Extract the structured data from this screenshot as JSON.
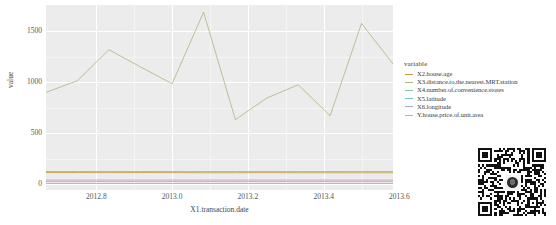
{
  "chart_data": {
    "type": "line",
    "title": "",
    "xlabel": "X1.transaction.date",
    "ylabel": "value",
    "legend_title": "variable",
    "legend_position": "right",
    "grid": true,
    "xlim": [
      2012.667,
      2013.583
    ],
    "ylim": [
      -60,
      1760
    ],
    "xticks": [
      "2012.8",
      "2013.0",
      "2013.2",
      "2013.4",
      "2013.6"
    ],
    "xtick_values": [
      2012.8,
      2013.0,
      2013.2,
      2013.4,
      2013.6
    ],
    "yticks": [
      "0",
      "500",
      "1000",
      "1500"
    ],
    "ytick_values": [
      0,
      500,
      1000,
      1500
    ],
    "x": [
      2012.667,
      2012.75,
      2012.833,
      2012.917,
      2013.0,
      2013.083,
      2013.167,
      2013.25,
      2013.333,
      2013.417,
      2013.5,
      2013.583
    ],
    "series": [
      {
        "name": "X2.house.age",
        "color": "#b8860b",
        "values": [
          112,
          112,
          111,
          112,
          111,
          110,
          110,
          111,
          110,
          110,
          109,
          109
        ]
      },
      {
        "name": "X3.distance.to.the.nearest.MRT.station",
        "color": "#9aa86b",
        "values": [
          900,
          1015,
          1320,
          1150,
          985,
          1690,
          632,
          845,
          975,
          670,
          1580,
          1180
        ]
      },
      {
        "name": "X4.number.of.convenience.stores",
        "color": "#5fbf8f",
        "values": [
          4,
          4,
          4,
          4,
          4,
          4,
          4,
          4,
          4,
          4,
          4,
          4
        ]
      },
      {
        "name": "X5.latitude",
        "color": "#4fb3c9",
        "values": [
          25,
          25,
          25,
          25,
          25,
          25,
          25,
          25,
          25,
          25,
          25,
          25
        ]
      },
      {
        "name": "X6.longitude",
        "color": "#9a8ed8",
        "values": [
          122,
          122,
          122,
          122,
          122,
          122,
          122,
          122,
          122,
          122,
          122,
          122
        ]
      },
      {
        "name": "Y.house.price.of.unit.area",
        "color": "#e07ab5",
        "values": [
          38,
          38,
          38,
          38,
          38,
          38,
          38,
          38,
          38,
          38,
          38,
          38
        ]
      }
    ]
  },
  "axes": {
    "y_title": "value",
    "x_title": "X1.transaction.date",
    "yticks": [
      "1500",
      "1000",
      "500",
      "0"
    ],
    "xticks": [
      "2012.8",
      "2013.0",
      "2013.2",
      "2013.4",
      "2013.6"
    ]
  },
  "legend": {
    "title": "variable",
    "items": [
      {
        "label": "X2.house.age",
        "color": "#b8860b"
      },
      {
        "label": "X3.distance.to.the.nearest.MRT.station",
        "color": "#9aa86b"
      },
      {
        "label": "X4.number.of.convenience.stores",
        "color": "#5fbf8f"
      },
      {
        "label": "X5.latitude",
        "color": "#4fb3c9"
      },
      {
        "label": "X6.longitude",
        "color": "#9a8ed8"
      },
      {
        "label": "Y.house.price.of.unit.area",
        "color": "#e07ab5"
      }
    ]
  },
  "qr_code": {
    "name": "qr-code",
    "logo": "circular-logo"
  },
  "colors": {
    "panel_background": "#ebebeb",
    "grid_major": "#ffffff",
    "page_background": "#ffffff",
    "text": "#4d4d4d"
  }
}
